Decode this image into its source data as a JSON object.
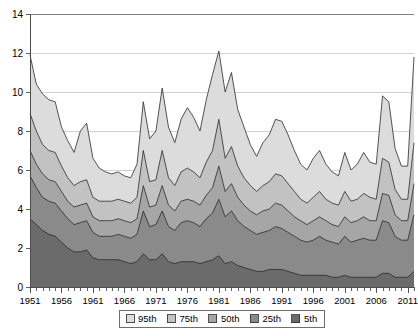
{
  "chart_data": {
    "type": "area",
    "title": "",
    "subtitle": "",
    "xlabel": "",
    "ylabel": "",
    "xlim": [
      1951,
      2012
    ],
    "ylim": [
      0,
      14
    ],
    "yticks": [
      0,
      2,
      4,
      6,
      8,
      10,
      12,
      14
    ],
    "ytick_labels": [
      "0",
      "2",
      "4",
      "6",
      "8",
      "10",
      "12",
      "14"
    ],
    "xticks": [
      1951,
      1956,
      1961,
      1966,
      1971,
      1976,
      1981,
      1986,
      1991,
      1996,
      2001,
      2006,
      2011
    ],
    "xtick_labels": [
      "1951",
      "1956",
      "1961",
      "1966",
      "1971",
      "1976",
      "1981",
      "1986",
      "1991",
      "1996",
      "2001",
      "2006",
      "2011"
    ],
    "minor_xticks_every": 1,
    "grid": "horizontal",
    "stacked": false,
    "legend_position": "bottom",
    "colors": {
      "95th": "#dcdcdc",
      "75th": "#c2c2c2",
      "50th": "#a6a6a6",
      "25th": "#8a8a8a",
      "5th": "#6b6b6b",
      "line": "#2b2b2b",
      "grid": "#d2d2d2",
      "axis": "#4d4d4d"
    },
    "x": [
      1951,
      1952,
      1953,
      1954,
      1955,
      1956,
      1957,
      1958,
      1959,
      1960,
      1961,
      1962,
      1963,
      1964,
      1965,
      1966,
      1967,
      1968,
      1969,
      1970,
      1971,
      1972,
      1973,
      1974,
      1975,
      1976,
      1977,
      1978,
      1979,
      1980,
      1981,
      1982,
      1983,
      1984,
      1985,
      1986,
      1987,
      1988,
      1989,
      1990,
      1991,
      1992,
      1993,
      1994,
      1995,
      1996,
      1997,
      1998,
      1999,
      2000,
      2001,
      2002,
      2003,
      2004,
      2005,
      2006,
      2007,
      2008,
      2009,
      2010,
      2011,
      2012
    ],
    "series": [
      {
        "name": "95th",
        "label": "95th",
        "color": "#dcdcdc",
        "values": [
          11.9,
          10.4,
          9.9,
          9.6,
          9.5,
          8.2,
          7.5,
          6.9,
          8.0,
          8.4,
          6.6,
          6.1,
          5.9,
          5.8,
          5.9,
          5.7,
          5.6,
          6.3,
          9.5,
          7.6,
          8.0,
          10.2,
          8.2,
          7.4,
          8.6,
          9.2,
          8.7,
          8.0,
          9.6,
          10.9,
          12.1,
          10.0,
          11.0,
          9.1,
          8.2,
          7.3,
          6.7,
          7.4,
          7.8,
          8.6,
          8.5,
          7.8,
          7.0,
          6.3,
          6.0,
          6.6,
          7.0,
          6.3,
          5.9,
          5.7,
          6.9,
          6.0,
          6.3,
          6.9,
          6.4,
          6.3,
          9.8,
          9.5,
          7.1,
          6.2,
          6.2,
          11.8
        ]
      },
      {
        "name": "75th",
        "label": "75th",
        "color": "#c2c2c2",
        "values": [
          8.9,
          8.0,
          7.3,
          7.0,
          6.9,
          6.2,
          5.6,
          5.2,
          5.4,
          5.5,
          4.6,
          4.4,
          4.4,
          4.4,
          4.5,
          4.4,
          4.3,
          4.6,
          7.0,
          5.4,
          5.5,
          7.0,
          5.6,
          5.2,
          5.9,
          6.1,
          5.9,
          5.6,
          6.4,
          7.0,
          8.6,
          6.6,
          7.2,
          6.2,
          5.6,
          5.2,
          4.9,
          5.2,
          5.4,
          5.8,
          5.7,
          5.3,
          4.9,
          4.5,
          4.3,
          4.6,
          4.9,
          4.5,
          4.3,
          4.2,
          4.9,
          4.4,
          4.5,
          4.8,
          4.6,
          4.5,
          6.6,
          6.4,
          5.0,
          4.5,
          4.5,
          7.4
        ]
      },
      {
        "name": "50th",
        "label": "50th",
        "color": "#a6a6a6",
        "values": [
          7.0,
          6.3,
          5.8,
          5.5,
          5.4,
          4.9,
          4.4,
          4.1,
          4.2,
          4.3,
          3.6,
          3.4,
          3.4,
          3.4,
          3.5,
          3.4,
          3.3,
          3.5,
          5.2,
          4.1,
          4.2,
          5.2,
          4.2,
          3.9,
          4.4,
          4.5,
          4.4,
          4.2,
          4.7,
          5.1,
          6.2,
          4.9,
          5.3,
          4.6,
          4.2,
          3.9,
          3.7,
          3.9,
          4.0,
          4.3,
          4.2,
          3.9,
          3.6,
          3.4,
          3.2,
          3.4,
          3.6,
          3.4,
          3.2,
          3.1,
          3.6,
          3.3,
          3.4,
          3.6,
          3.4,
          3.4,
          4.8,
          4.7,
          3.7,
          3.4,
          3.4,
          5.3
        ]
      },
      {
        "name": "25th",
        "label": "25th",
        "color": "#8a8a8a",
        "values": [
          5.7,
          5.1,
          4.6,
          4.4,
          4.3,
          3.9,
          3.5,
          3.2,
          3.3,
          3.4,
          2.8,
          2.6,
          2.6,
          2.6,
          2.7,
          2.6,
          2.5,
          2.7,
          3.9,
          3.1,
          3.2,
          3.9,
          3.1,
          2.9,
          3.3,
          3.4,
          3.3,
          3.1,
          3.5,
          3.8,
          4.5,
          3.6,
          3.9,
          3.4,
          3.1,
          2.9,
          2.7,
          2.8,
          2.9,
          3.1,
          3.0,
          2.8,
          2.6,
          2.4,
          2.3,
          2.4,
          2.6,
          2.4,
          2.3,
          2.2,
          2.6,
          2.3,
          2.4,
          2.5,
          2.4,
          2.4,
          3.4,
          3.3,
          2.6,
          2.4,
          2.4,
          3.7
        ]
      },
      {
        "name": "5th",
        "label": "5th",
        "color": "#6b6b6b",
        "values": [
          3.5,
          3.2,
          2.9,
          2.7,
          2.6,
          2.3,
          2.0,
          1.8,
          1.8,
          1.9,
          1.5,
          1.4,
          1.4,
          1.4,
          1.4,
          1.3,
          1.2,
          1.3,
          1.7,
          1.4,
          1.4,
          1.7,
          1.3,
          1.2,
          1.3,
          1.3,
          1.3,
          1.2,
          1.3,
          1.4,
          1.6,
          1.2,
          1.3,
          1.1,
          1.0,
          0.9,
          0.8,
          0.8,
          0.9,
          0.9,
          0.9,
          0.8,
          0.7,
          0.6,
          0.6,
          0.6,
          0.6,
          0.6,
          0.5,
          0.5,
          0.6,
          0.5,
          0.5,
          0.5,
          0.5,
          0.5,
          0.7,
          0.7,
          0.5,
          0.5,
          0.5,
          0.8
        ]
      }
    ],
    "legend": [
      {
        "label": "95th",
        "color": "#dcdcdc"
      },
      {
        "label": "75th",
        "color": "#c2c2c2"
      },
      {
        "label": "50th",
        "color": "#a6a6a6"
      },
      {
        "label": "25th",
        "color": "#8a8a8a"
      },
      {
        "label": "5th",
        "color": "#6b6b6b"
      }
    ]
  }
}
